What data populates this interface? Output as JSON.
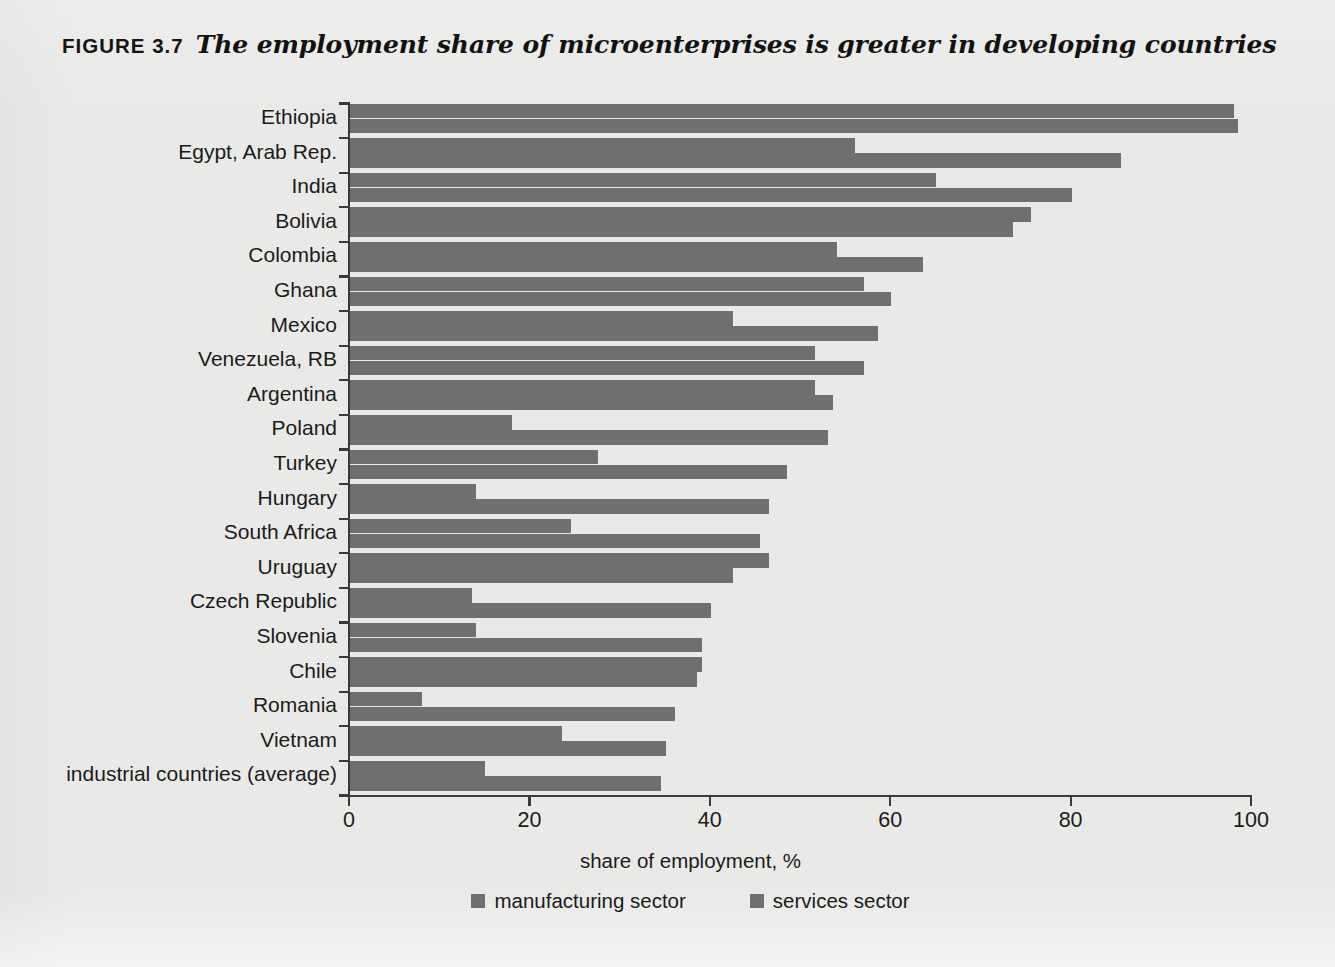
{
  "figure": {
    "number_label": "FIGURE 3.7",
    "title": "The employment share of microenterprises is greater in developing countries"
  },
  "colors": {
    "bar": "#6f6f6f",
    "axis": "#3a3a3a",
    "page_background": "#e9e9e7",
    "text": "#1b1b1b"
  },
  "chart_data": {
    "type": "bar",
    "orientation": "horizontal",
    "grouped": true,
    "title": "The employment share of microenterprises is greater in developing countries",
    "xlabel": "share of employment, %",
    "ylabel": "",
    "xlim": [
      0,
      100
    ],
    "xticks": [
      0,
      20,
      40,
      60,
      80,
      100
    ],
    "xtick_labels": [
      "0",
      "20",
      "40",
      "60",
      "80",
      "100"
    ],
    "grid": false,
    "legend_position": "bottom",
    "categories": [
      "Ethiopia",
      "Egypt, Arab Rep.",
      "India",
      "Bolivia",
      "Colombia",
      "Ghana",
      "Mexico",
      "Venezuela, RB",
      "Argentina",
      "Poland",
      "Turkey",
      "Hungary",
      "South Africa",
      "Uruguay",
      "Czech Republic",
      "Slovenia",
      "Chile",
      "Romania",
      "Vietnam",
      "industrial countries (average)"
    ],
    "series": [
      {
        "name": "manufacturing sector",
        "color": "#6f6f6f",
        "values": [
          98,
          56,
          65,
          75.5,
          54,
          57,
          42.5,
          51.5,
          51.5,
          18,
          27.5,
          14,
          24.5,
          46.5,
          13.5,
          14,
          39,
          8,
          23.5,
          15
        ]
      },
      {
        "name": "services sector",
        "color": "#6f6f6f",
        "values": [
          98.5,
          85.5,
          80,
          73.5,
          63.5,
          60,
          58.5,
          57,
          53.5,
          53,
          48.5,
          46.5,
          45.5,
          42.5,
          40,
          39,
          38.5,
          36,
          35,
          34.5
        ]
      }
    ]
  }
}
